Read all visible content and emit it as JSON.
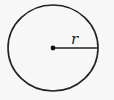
{
  "diagram": {
    "type": "circle-with-radius",
    "circle": {
      "cx": 53,
      "cy": 48,
      "rx": 45,
      "ry": 43,
      "stroke": "#222222",
      "stroke_width": 1.6
    },
    "center_point": {
      "x": 53,
      "y": 48,
      "r": 2.4
    },
    "radius_line": {
      "x1": 53,
      "y1": 48,
      "x2": 98,
      "y2": 48
    },
    "radius_label": {
      "text": "r",
      "x": 71,
      "y": 44
    }
  }
}
